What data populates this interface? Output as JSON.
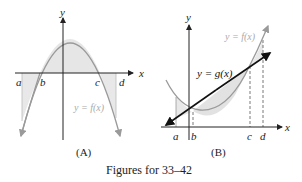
{
  "figure": {
    "caption": "Figures for 33–42",
    "panels": [
      {
        "id": "A",
        "label": "(A)",
        "axis_x": "x",
        "axis_y": "y",
        "curve_label": "y = f(x)",
        "points": [
          "a",
          "b",
          "c",
          "d"
        ],
        "description": "Downward parabola y = f(x) crossing x-axis at b and c; shaded region between curve and x-axis from a to d"
      },
      {
        "id": "B",
        "label": "(B)",
        "axis_x": "x",
        "axis_y": "y",
        "curve_label": "y = f(x)",
        "line_label": "y = g(x)",
        "points": [
          "a",
          "b",
          "c",
          "d"
        ],
        "description": "Upward parabola y = f(x) and line y = g(x) intersecting at b and c; shaded regions between curves from a to d"
      }
    ]
  },
  "colors": {
    "axis": "#222222",
    "curve": "#9a9a9a",
    "shade": "#e6e6e6",
    "line": "#111111",
    "dashed": "#555555"
  }
}
